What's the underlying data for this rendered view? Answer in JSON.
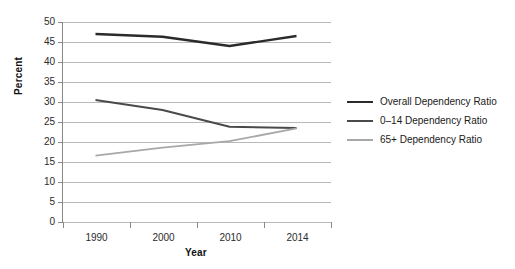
{
  "chart_data": {
    "type": "line",
    "title": "",
    "xlabel": "Year",
    "ylabel": "Percent",
    "categories": [
      "1990",
      "2000",
      "2010",
      "2014"
    ],
    "ylim": [
      0,
      50
    ],
    "yticks": [
      0,
      5,
      10,
      15,
      20,
      25,
      30,
      35,
      40,
      45,
      50
    ],
    "ytick_labels": [
      "0",
      "5",
      "10",
      "15",
      "20",
      "25",
      "30",
      "35",
      "40",
      "45",
      "50"
    ],
    "grid": true,
    "legend_position": "right",
    "series": [
      {
        "name": "Overall Dependency Ratio",
        "color": "#2b2b2b",
        "width": 2.4,
        "values": [
          47.0,
          46.3,
          44.0,
          46.5
        ]
      },
      {
        "name": "0–14 Dependency Ratio",
        "color": "#4a4a4a",
        "width": 2.0,
        "values": [
          30.5,
          28.0,
          23.8,
          23.5
        ]
      },
      {
        "name": "65+ Dependency Ratio",
        "color": "#a8a8a8",
        "width": 1.8,
        "values": [
          16.6,
          18.6,
          20.2,
          23.4
        ]
      }
    ]
  },
  "colors": {
    "background": "#ffffff",
    "axis": "#8a8a8a",
    "gridline": "#b9b9b9",
    "text": "#1a1a1a"
  }
}
